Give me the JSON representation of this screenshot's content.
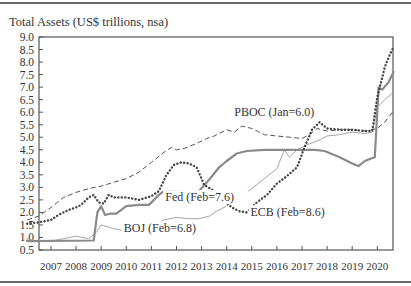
{
  "chart_data": {
    "type": "line",
    "title": "Total Assets (US$ trillions, nsa)",
    "xlabel": "",
    "ylabel": "",
    "xlim": [
      2006.0,
      2020.75
    ],
    "ylim": [
      0.5,
      9.0
    ],
    "y_ticks": [
      "9.0",
      "8.5",
      "8.0",
      "7.5",
      "7.0",
      "6.5",
      "6.0",
      "5.5",
      "5.0",
      "4.5",
      "4.0",
      "3.5",
      "3.0",
      "2.5",
      "2.0",
      "1.5",
      "1.0",
      "0.5"
    ],
    "x_ticks": [
      "2007",
      "2008",
      "2009",
      "2010",
      "2011",
      "2012",
      "2013",
      "2014",
      "2015",
      "2016",
      "2017",
      "2018",
      "2019",
      "2020"
    ],
    "grid": false,
    "legend": "inline labels",
    "series": [
      {
        "name": "Fed",
        "label": "Fed (Feb=7.6)",
        "style": "solid-thick",
        "color": "#8a8a8a",
        "points": [
          [
            2006.05,
            0.85
          ],
          [
            2008.7,
            0.88
          ],
          [
            2008.85,
            2.0
          ],
          [
            2009.0,
            2.25
          ],
          [
            2009.15,
            1.9
          ],
          [
            2009.35,
            1.95
          ],
          [
            2009.6,
            1.95
          ],
          [
            2010.0,
            2.25
          ],
          [
            2010.5,
            2.3
          ],
          [
            2010.9,
            2.3
          ],
          [
            2011.3,
            2.7
          ],
          [
            2011.5,
            2.85
          ],
          [
            2012.0,
            2.85
          ],
          [
            2012.5,
            2.8
          ],
          [
            2012.9,
            2.85
          ],
          [
            2013.3,
            3.3
          ],
          [
            2013.7,
            3.8
          ],
          [
            2014.0,
            4.05
          ],
          [
            2014.4,
            4.35
          ],
          [
            2014.8,
            4.45
          ],
          [
            2015.5,
            4.5
          ],
          [
            2016.5,
            4.5
          ],
          [
            2017.5,
            4.5
          ],
          [
            2017.9,
            4.45
          ],
          [
            2018.5,
            4.2
          ],
          [
            2019.0,
            3.95
          ],
          [
            2019.25,
            3.85
          ],
          [
            2019.5,
            4.05
          ],
          [
            2019.75,
            4.15
          ],
          [
            2019.9,
            4.2
          ],
          [
            2020.05,
            7.0
          ],
          [
            2020.2,
            6.9
          ],
          [
            2020.45,
            7.2
          ],
          [
            2020.65,
            7.6
          ]
        ]
      },
      {
        "name": "ECB",
        "label": "ECB (Feb=8.6)",
        "style": "dotted",
        "color": "#444444",
        "points": [
          [
            2006.05,
            1.55
          ],
          [
            2006.5,
            1.6
          ],
          [
            2007.0,
            1.7
          ],
          [
            2007.3,
            1.9
          ],
          [
            2007.7,
            2.1
          ],
          [
            2008.0,
            2.2
          ],
          [
            2008.2,
            2.3
          ],
          [
            2008.5,
            2.6
          ],
          [
            2008.7,
            2.7
          ],
          [
            2008.9,
            2.4
          ],
          [
            2009.1,
            2.35
          ],
          [
            2009.3,
            2.7
          ],
          [
            2009.5,
            2.6
          ],
          [
            2010.0,
            2.6
          ],
          [
            2010.5,
            2.5
          ],
          [
            2011.0,
            2.65
          ],
          [
            2011.3,
            2.85
          ],
          [
            2011.6,
            3.5
          ],
          [
            2011.9,
            3.9
          ],
          [
            2012.2,
            4.0
          ],
          [
            2012.5,
            3.95
          ],
          [
            2012.8,
            3.8
          ],
          [
            2013.1,
            3.1
          ],
          [
            2013.5,
            2.85
          ],
          [
            2013.8,
            2.55
          ],
          [
            2014.2,
            2.2
          ],
          [
            2014.5,
            2.05
          ],
          [
            2014.8,
            2.0
          ],
          [
            2015.2,
            2.4
          ],
          [
            2015.6,
            2.7
          ],
          [
            2016.0,
            3.15
          ],
          [
            2016.4,
            3.45
          ],
          [
            2016.8,
            3.8
          ],
          [
            2017.1,
            4.6
          ],
          [
            2017.4,
            5.3
          ],
          [
            2017.7,
            5.6
          ],
          [
            2018.0,
            5.35
          ],
          [
            2018.5,
            5.3
          ],
          [
            2019.0,
            5.3
          ],
          [
            2019.5,
            5.25
          ],
          [
            2019.8,
            5.25
          ],
          [
            2020.0,
            6.6
          ],
          [
            2020.3,
            7.8
          ],
          [
            2020.5,
            8.3
          ],
          [
            2020.65,
            8.6
          ]
        ]
      },
      {
        "name": "PBOC",
        "label": "PBOC (Jan=6.0)",
        "style": "dashed",
        "color": "#555555",
        "points": [
          [
            2006.05,
            1.7
          ],
          [
            2006.5,
            1.85
          ],
          [
            2007.0,
            2.2
          ],
          [
            2007.5,
            2.6
          ],
          [
            2008.0,
            2.8
          ],
          [
            2008.5,
            2.95
          ],
          [
            2009.0,
            3.05
          ],
          [
            2009.5,
            3.2
          ],
          [
            2010.0,
            3.35
          ],
          [
            2010.5,
            3.6
          ],
          [
            2011.0,
            4.0
          ],
          [
            2011.5,
            4.4
          ],
          [
            2011.8,
            4.6
          ],
          [
            2012.0,
            4.5
          ],
          [
            2012.3,
            4.55
          ],
          [
            2012.8,
            4.75
          ],
          [
            2013.2,
            4.95
          ],
          [
            2013.5,
            5.05
          ],
          [
            2014.0,
            5.3
          ],
          [
            2014.3,
            5.2
          ],
          [
            2014.6,
            5.45
          ],
          [
            2015.0,
            5.35
          ],
          [
            2015.5,
            5.1
          ],
          [
            2016.0,
            5.05
          ],
          [
            2016.5,
            5.0
          ],
          [
            2017.0,
            4.95
          ],
          [
            2017.3,
            5.1
          ],
          [
            2017.6,
            5.35
          ],
          [
            2018.0,
            5.25
          ],
          [
            2018.5,
            5.3
          ],
          [
            2019.0,
            5.3
          ],
          [
            2019.5,
            5.25
          ],
          [
            2020.0,
            5.35
          ],
          [
            2020.3,
            5.6
          ],
          [
            2020.6,
            6.0
          ]
        ]
      },
      {
        "name": "BOJ",
        "label": "BOJ (Feb=6.8)",
        "style": "solid-thin",
        "color": "#9a9a9a",
        "points": [
          [
            2006.05,
            0.95
          ],
          [
            2006.5,
            0.85
          ],
          [
            2007.0,
            0.85
          ],
          [
            2007.5,
            0.95
          ],
          [
            2008.0,
            1.05
          ],
          [
            2008.5,
            0.95
          ],
          [
            2008.8,
            1.2
          ],
          [
            2009.0,
            1.5
          ],
          [
            2009.5,
            1.35
          ],
          [
            2010.0,
            1.25
          ],
          [
            2010.5,
            1.4
          ],
          [
            2011.0,
            1.45
          ],
          [
            2011.5,
            1.7
          ],
          [
            2012.0,
            1.8
          ],
          [
            2012.5,
            1.75
          ],
          [
            2012.9,
            1.75
          ],
          [
            2013.3,
            1.85
          ],
          [
            2013.6,
            2.05
          ],
          [
            2014.0,
            2.25
          ],
          [
            2014.5,
            2.6
          ],
          [
            2015.0,
            2.95
          ],
          [
            2015.5,
            3.35
          ],
          [
            2016.0,
            3.75
          ],
          [
            2016.3,
            4.5
          ],
          [
            2016.5,
            4.2
          ],
          [
            2016.8,
            4.5
          ],
          [
            2017.2,
            4.7
          ],
          [
            2017.6,
            4.85
          ],
          [
            2018.0,
            5.05
          ],
          [
            2018.5,
            5.1
          ],
          [
            2019.0,
            5.2
          ],
          [
            2019.5,
            5.15
          ],
          [
            2019.8,
            5.2
          ],
          [
            2020.0,
            6.2
          ],
          [
            2020.3,
            6.5
          ],
          [
            2020.65,
            6.8
          ]
        ]
      }
    ],
    "annotations": [
      {
        "text": "PBOC (Jan=6.0)",
        "x": 2014.3,
        "y": 5.85
      },
      {
        "text": "Fed (Feb=7.6)",
        "x": 2011.55,
        "y": 2.45
      },
      {
        "text": "ECB (Feb=8.6)",
        "x": 2014.95,
        "y": 1.85
      },
      {
        "text": "BOJ (Feb=6.8)",
        "x": 2009.9,
        "y": 1.2
      }
    ]
  }
}
